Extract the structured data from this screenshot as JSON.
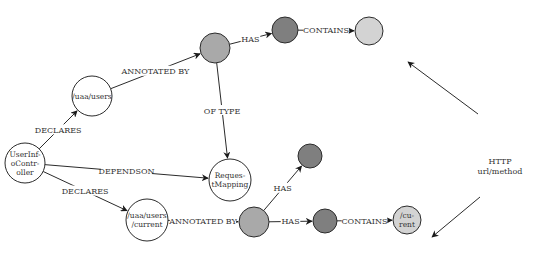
{
  "diagram": {
    "colors": {
      "white_node": "#ffffff",
      "annotation_node": "#a9a9a9",
      "attribute_node": "#7f7f7f",
      "value_node": "#d3d3d3",
      "stroke": "#2b2b2b"
    },
    "nodes": [
      {
        "id": "controller",
        "lines": [
          "UserInf-",
          "oContr-",
          "oller"
        ],
        "cx": 25,
        "cy": 163,
        "r": 20,
        "fill": "white_node"
      },
      {
        "id": "users",
        "lines": [
          "/uaa/users"
        ],
        "cx": 92,
        "cy": 96,
        "r": 20,
        "fill": "white_node"
      },
      {
        "id": "annot_top",
        "lines": [],
        "cx": 215,
        "cy": 48,
        "r": 15,
        "fill": "annotation_node"
      },
      {
        "id": "attr_top",
        "lines": [],
        "cx": 285,
        "cy": 30,
        "r": 13,
        "fill": "attribute_node"
      },
      {
        "id": "value_top",
        "lines": [],
        "cx": 369,
        "cy": 31,
        "r": 14,
        "fill": "value_node"
      },
      {
        "id": "reqmap",
        "lines": [
          "Reques-",
          "tMapping"
        ],
        "cx": 230,
        "cy": 180,
        "r": 21,
        "fill": "white_node"
      },
      {
        "id": "attr_mid",
        "lines": [],
        "cx": 310,
        "cy": 156,
        "r": 12,
        "fill": "attribute_node"
      },
      {
        "id": "current",
        "lines": [
          "/uaa/users",
          "/current"
        ],
        "cx": 147,
        "cy": 220,
        "r": 21,
        "fill": "white_node"
      },
      {
        "id": "annot_bot",
        "lines": [],
        "cx": 254,
        "cy": 222,
        "r": 15,
        "fill": "annotation_node"
      },
      {
        "id": "attr_bot",
        "lines": [],
        "cx": 325,
        "cy": 221,
        "r": 12,
        "fill": "attribute_node"
      },
      {
        "id": "value_bot",
        "lines": [
          "/cu-",
          "rent"
        ],
        "cx": 407,
        "cy": 220,
        "r": 14,
        "fill": "value_node"
      }
    ],
    "edges": [
      {
        "from": "controller",
        "to": "users",
        "label": "DECLARES"
      },
      {
        "from": "users",
        "to": "annot_top",
        "label": "ANNOTATED BY"
      },
      {
        "from": "annot_top",
        "to": "attr_top",
        "label": "HAS"
      },
      {
        "from": "attr_top",
        "to": "value_top",
        "label": "CONTAINS"
      },
      {
        "from": "annot_top",
        "to": "reqmap",
        "label": "OF TYPE"
      },
      {
        "from": "controller",
        "to": "reqmap",
        "label": "DEPENDSON"
      },
      {
        "from": "controller",
        "to": "current",
        "label": "DECLARES"
      },
      {
        "from": "current",
        "to": "annot_bot",
        "label": "ANNOTATED BY"
      },
      {
        "from": "annot_bot",
        "to": "attr_mid",
        "label": "HAS"
      },
      {
        "from": "annot_bot",
        "to": "attr_bot",
        "label": "HAS"
      },
      {
        "from": "attr_bot",
        "to": "value_bot",
        "label": "CONTAINS"
      }
    ],
    "annotation": {
      "lines": [
        "HTTP",
        "url/method"
      ],
      "x": 500,
      "y": 164,
      "arrows": [
        {
          "x1": 478,
          "y1": 114,
          "x2": 408,
          "y2": 62
        },
        {
          "x1": 480,
          "y1": 197,
          "x2": 432,
          "y2": 237
        }
      ]
    }
  }
}
